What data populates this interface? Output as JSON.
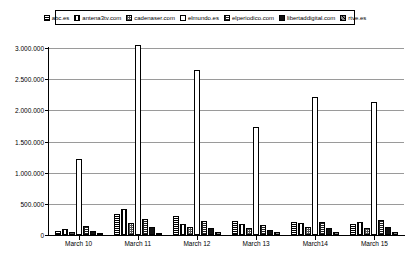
{
  "chart_data": {
    "type": "bar",
    "title": "",
    "xlabel": "",
    "ylabel": "",
    "grid": true,
    "legend_position": "top",
    "ylim": [
      0,
      3000000
    ],
    "yticks": [
      "0",
      "500.000",
      "1.000.000",
      "1.500.000",
      "2.000.000",
      "2.500.000",
      "3.000.000"
    ],
    "ytick_values": [
      0,
      500000,
      1000000,
      1500000,
      2000000,
      2500000,
      3000000
    ],
    "categories": [
      "March 10",
      "March 11",
      "March 12",
      "March 13",
      "March14",
      "March 15"
    ],
    "series": [
      {
        "name": "abc.es",
        "pattern": "p-abc",
        "values": [
          60000,
          330000,
          300000,
          230000,
          210000,
          170000
        ]
      },
      {
        "name": "antena3tv.com",
        "pattern": "p-antena",
        "values": [
          95000,
          420000,
          180000,
          180000,
          185000,
          210000
        ]
      },
      {
        "name": "cadenaser.com",
        "pattern": "p-cadena",
        "values": [
          55000,
          200000,
          130000,
          120000,
          130000,
          120000
        ]
      },
      {
        "name": "elmundo.es",
        "pattern": "p-elmundo",
        "values": [
          1220000,
          3050000,
          2640000,
          1730000,
          2210000,
          2140000
        ]
      },
      {
        "name": "elperiodico.com",
        "pattern": "p-elperiodico",
        "values": [
          150000,
          255000,
          230000,
          160000,
          215000,
          240000
        ]
      },
      {
        "name": "libertaddigital.com",
        "pattern": "p-libertad",
        "values": [
          60000,
          130000,
          120000,
          85000,
          105000,
          130000
        ]
      },
      {
        "name": "rtve.es",
        "pattern": "p-rtve",
        "values": [
          25000,
          40000,
          55000,
          45000,
          45000,
          45000
        ]
      }
    ]
  },
  "legend": {
    "items": [
      {
        "label": "abc.es",
        "swatch": "p-abc"
      },
      {
        "label": "antena3tv.com",
        "swatch": "p-antena"
      },
      {
        "label": "cadenaser.com",
        "swatch": "p-cadena"
      },
      {
        "label": "elmundo.es",
        "swatch": "p-elmundo"
      },
      {
        "label": "elperiodico.com",
        "swatch": "p-elperiodico"
      },
      {
        "label": "libertaddigital.com",
        "swatch": "p-libertad"
      },
      {
        "label": "rtve.es",
        "swatch": "p-rtve"
      }
    ]
  },
  "colors": {
    "background": "#ffffff",
    "axis": "#000000",
    "gridline": "#9a9a9a",
    "text": "#000000"
  }
}
